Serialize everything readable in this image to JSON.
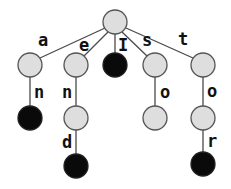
{
  "diagram": {
    "type": "trie",
    "colors": {
      "internal_node": "#dedede",
      "terminal_node": "#0a0a0a",
      "edge": "#4a4a4a"
    },
    "nodes": [
      {
        "id": "root",
        "x": 115,
        "y": 22,
        "terminal": false
      },
      {
        "id": "a",
        "x": 30,
        "y": 65,
        "terminal": false
      },
      {
        "id": "e",
        "x": 76,
        "y": 65,
        "terminal": false
      },
      {
        "id": "I",
        "x": 115,
        "y": 65,
        "terminal": true
      },
      {
        "id": "s",
        "x": 155,
        "y": 65,
        "terminal": false
      },
      {
        "id": "t",
        "x": 203,
        "y": 65,
        "terminal": false
      },
      {
        "id": "an",
        "x": 30,
        "y": 118,
        "terminal": true
      },
      {
        "id": "en",
        "x": 76,
        "y": 118,
        "terminal": false
      },
      {
        "id": "so",
        "x": 155,
        "y": 118,
        "terminal": false
      },
      {
        "id": "to",
        "x": 203,
        "y": 118,
        "terminal": false
      },
      {
        "id": "end",
        "x": 76,
        "y": 166,
        "terminal": true
      },
      {
        "id": "tor",
        "x": 203,
        "y": 164,
        "terminal": true
      }
    ],
    "edges": [
      {
        "from": "root",
        "to": "a",
        "label": "a"
      },
      {
        "from": "root",
        "to": "e",
        "label": "e"
      },
      {
        "from": "root",
        "to": "I",
        "label": "I"
      },
      {
        "from": "root",
        "to": "s",
        "label": "s"
      },
      {
        "from": "root",
        "to": "t",
        "label": "t"
      },
      {
        "from": "a",
        "to": "an",
        "label": "n"
      },
      {
        "from": "e",
        "to": "en",
        "label": "n"
      },
      {
        "from": "s",
        "to": "so",
        "label": "o"
      },
      {
        "from": "t",
        "to": "to",
        "label": "o"
      },
      {
        "from": "en",
        "to": "end",
        "label": "d"
      },
      {
        "from": "to",
        "to": "tor",
        "label": "r"
      }
    ],
    "edge_labels": {
      "root_a": "a",
      "root_e": "e",
      "root_I": "I",
      "root_s": "s",
      "root_t": "t",
      "a_n": "n",
      "e_n": "n",
      "s_o": "o",
      "t_o": "o",
      "en_d": "d",
      "to_r": "r"
    }
  }
}
